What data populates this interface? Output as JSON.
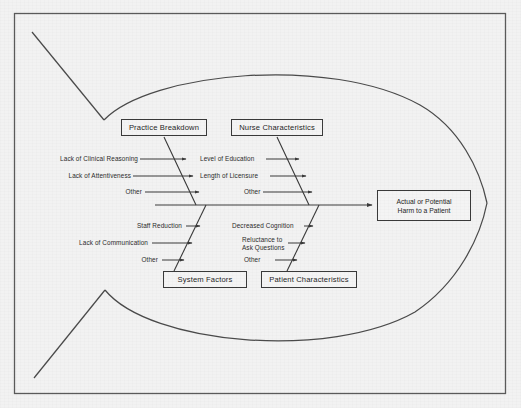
{
  "diagram": {
    "type": "fishbone-ishikawa",
    "title": "",
    "effect": {
      "line1": "Actual or Potential",
      "line2": "Harm to a Patient"
    },
    "categories": [
      {
        "id": "practice-breakdown",
        "label": "Practice Breakdown",
        "position": "upper-left",
        "causes": [
          "Lack of Clinical Reasoning",
          "Lack of Attentiveness",
          "Other"
        ]
      },
      {
        "id": "nurse-characteristics",
        "label": "Nurse Characteristics",
        "position": "upper-right",
        "causes": [
          "Level of Education",
          "Length of Licensure",
          "Other"
        ]
      },
      {
        "id": "system-factors",
        "label": "System Factors",
        "position": "lower-left",
        "causes": [
          "Staff Reduction",
          "Lack of Communication",
          "Other"
        ]
      },
      {
        "id": "patient-characteristics",
        "label": "Patient Characteristics",
        "position": "lower-right",
        "causes": [
          "Decreased Cognition",
          "Reluctance to",
          "Ask Questions",
          "Other"
        ]
      }
    ],
    "cause_labels": {
      "pb1": "Lack of Clinical Reasoning",
      "pb2": "Lack of Attentiveness",
      "pb3": "Other",
      "nc1": "Level of Education",
      "nc2": "Length of Licensure",
      "nc3": "Other",
      "sf1": "Staff Reduction",
      "sf2": "Lack of Communication",
      "sf3": "Other",
      "pc1": "Decreased Cognition",
      "pc2a": "Reluctance to",
      "pc2b": "Ask Questions",
      "pc3": "Other"
    },
    "colors": {
      "background": "#f2f2f2",
      "ink": "#3a3a3a",
      "text": "#1f1f1f",
      "frame": "#4a4a4a",
      "box_fill": "#f4f4f4"
    }
  }
}
